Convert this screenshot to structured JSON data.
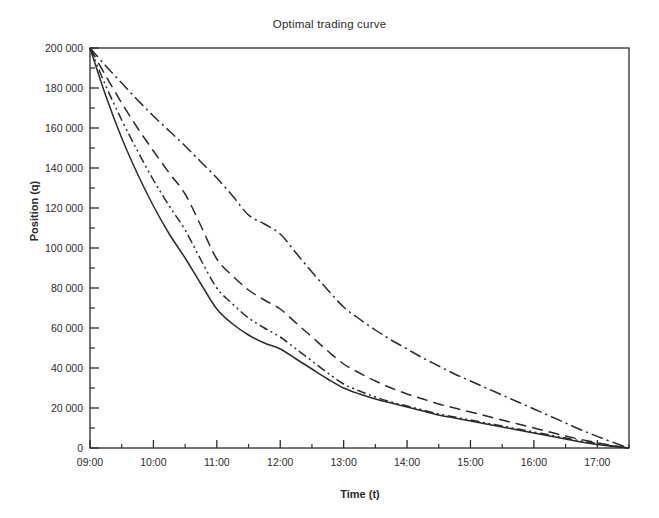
{
  "chart_data": {
    "type": "line",
    "title": "Optimal trading curve",
    "xlabel": "Time (t)",
    "ylabel": "Position (q)",
    "grid": false,
    "legend_position": "none",
    "x_tick_labels": [
      "09:00",
      "10:00",
      "11:00",
      "12:00",
      "13:00",
      "14:00",
      "15:00",
      "16:00",
      "17:00"
    ],
    "x_tick_values": [
      9,
      10,
      11,
      12,
      13,
      14,
      15,
      16,
      17
    ],
    "x_minor_tick_values": [
      9.5,
      10.5,
      11.5,
      12.5,
      13.5,
      14.5,
      15.5,
      16.5,
      17.5
    ],
    "xlim": [
      9,
      17.5
    ],
    "y_tick_labels": [
      "0",
      "20 000",
      "40 000",
      "60 000",
      "80 000",
      "100 000",
      "120 000",
      "140 000",
      "160 000",
      "180 000",
      "200 000"
    ],
    "y_tick_values": [
      0,
      20000,
      40000,
      60000,
      80000,
      100000,
      120000,
      140000,
      160000,
      180000,
      200000
    ],
    "y_minor_tick_values": [
      10000,
      30000,
      50000,
      70000,
      90000,
      110000,
      130000,
      150000,
      170000,
      190000
    ],
    "ylim": [
      0,
      200000
    ],
    "x": [
      9,
      9.25,
      9.5,
      9.75,
      10,
      10.25,
      10.5,
      10.75,
      11,
      11.25,
      11.5,
      11.75,
      12,
      12.25,
      12.5,
      12.75,
      13,
      13.25,
      13.5,
      13.75,
      14,
      14.25,
      14.5,
      14.75,
      15,
      15.25,
      15.5,
      15.75,
      16,
      16.25,
      16.5,
      16.75,
      17,
      17.25,
      17.5
    ],
    "series": [
      {
        "name": "curve-solid",
        "style": "solid",
        "color": "#2b2b2b",
        "values": [
          200000,
          176000,
          155000,
          137000,
          121000,
          107000,
          95000,
          82000,
          69500,
          62000,
          56500,
          52500,
          49500,
          44500,
          39500,
          34500,
          30000,
          27000,
          24500,
          22500,
          20500,
          18500,
          16500,
          15000,
          13500,
          12000,
          10500,
          9000,
          7500,
          6000,
          4500,
          3000,
          1800,
          800,
          0
        ]
      },
      {
        "name": "curve-dash-dot-dot",
        "style": "dash-dot-dot",
        "color": "#2b2b2b",
        "values": [
          200000,
          181000,
          164000,
          148500,
          134000,
          121000,
          109000,
          94000,
          80000,
          72000,
          65000,
          60000,
          55500,
          49500,
          43500,
          37500,
          32000,
          28500,
          25500,
          23000,
          21000,
          19000,
          17000,
          15500,
          14000,
          12500,
          11000,
          9500,
          8000,
          6500,
          5000,
          3500,
          2200,
          1000,
          0
        ]
      },
      {
        "name": "curve-dashed",
        "style": "dashed",
        "color": "#2b2b2b",
        "values": [
          200000,
          186000,
          172500,
          160000,
          148500,
          137500,
          127000,
          111000,
          94500,
          86000,
          79000,
          74000,
          69500,
          62500,
          55500,
          48500,
          42000,
          37500,
          33500,
          30000,
          27000,
          24500,
          22000,
          20000,
          18000,
          16000,
          14000,
          12000,
          10000,
          8000,
          6000,
          4200,
          2600,
          1200,
          0
        ]
      },
      {
        "name": "curve-dash-dot",
        "style": "dash-dot",
        "color": "#2b2b2b",
        "values": [
          200000,
          191000,
          182500,
          174000,
          166000,
          158500,
          151000,
          143000,
          135000,
          126000,
          116500,
          112000,
          107000,
          97500,
          88000,
          79000,
          70500,
          64500,
          59000,
          54000,
          49500,
          45000,
          41000,
          37000,
          33500,
          30000,
          26500,
          23000,
          19500,
          16000,
          12500,
          9000,
          5800,
          2800,
          0
        ]
      }
    ]
  }
}
